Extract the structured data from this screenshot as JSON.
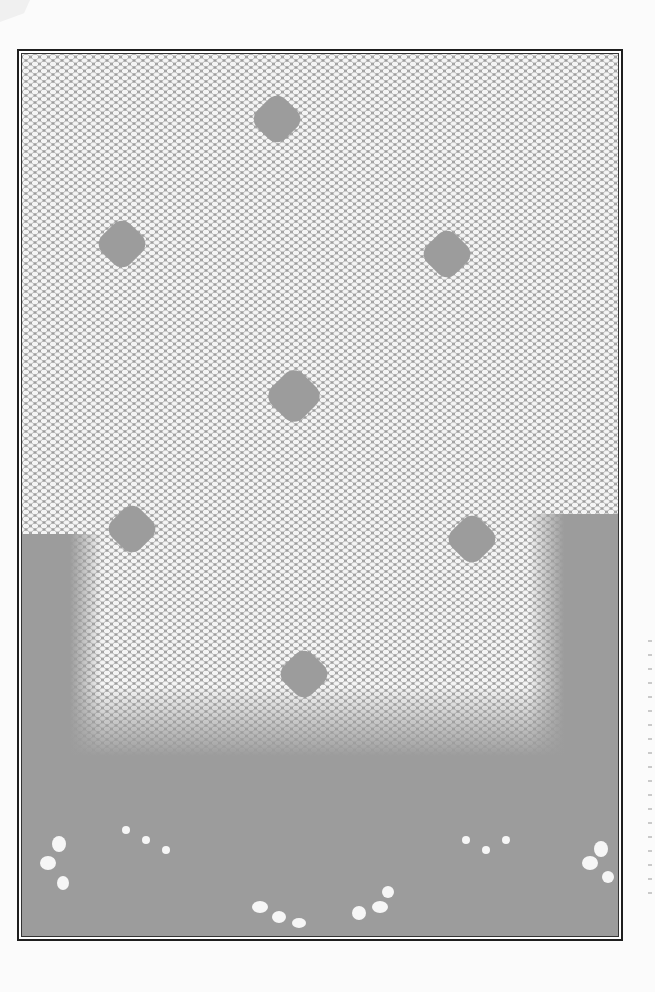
{
  "image": {
    "description": "Scanned page showing a gray filet-lace / mesh doily pattern inside a black double-line border frame",
    "colors": {
      "page": "#fbfbfb",
      "mesh_background": "#9c9c9c",
      "mesh_holes": "#f4f4f4",
      "frame_border": "#1e1e1e"
    },
    "motifs": [
      {
        "name": "diamond-top-center",
        "x": 270,
        "y": 115
      },
      {
        "name": "diamond-upper-left",
        "x": 117,
        "y": 245
      },
      {
        "name": "diamond-upper-right",
        "x": 447,
        "y": 255
      },
      {
        "name": "diamond-center",
        "x": 287,
        "y": 400
      },
      {
        "name": "diamond-mid-left",
        "x": 125,
        "y": 530
      },
      {
        "name": "diamond-mid-right",
        "x": 470,
        "y": 540
      },
      {
        "name": "diamond-lower-center",
        "x": 300,
        "y": 680
      }
    ]
  }
}
